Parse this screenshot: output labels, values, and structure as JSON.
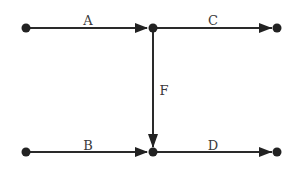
{
  "diagram": {
    "type": "directed-graph",
    "colors": {
      "edge": "#2a2a2a",
      "node": "#222222",
      "label": "#3a3a3a",
      "background": "#ffffff"
    },
    "nodes": [
      {
        "id": "n1",
        "x": 26,
        "y": 28
      },
      {
        "id": "n2",
        "x": 153,
        "y": 28
      },
      {
        "id": "n3",
        "x": 277,
        "y": 28
      },
      {
        "id": "n4",
        "x": 26,
        "y": 152
      },
      {
        "id": "n5",
        "x": 153,
        "y": 152
      },
      {
        "id": "n6",
        "x": 277,
        "y": 152
      }
    ],
    "edges": [
      {
        "label": "A",
        "from": "n1",
        "to": "n2"
      },
      {
        "label": "C",
        "from": "n2",
        "to": "n3"
      },
      {
        "label": "F",
        "from": "n2",
        "to": "n5"
      },
      {
        "label": "B",
        "from": "n4",
        "to": "n5"
      },
      {
        "label": "D",
        "from": "n5",
        "to": "n6"
      }
    ]
  }
}
